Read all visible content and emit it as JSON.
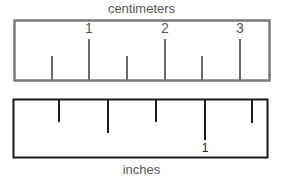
{
  "cm_ruler": {
    "title": "centimeters",
    "border_color": "#7a7a7a",
    "tick_color": "#6a6a6a",
    "labels": [
      {
        "text": "1",
        "x": 89
      },
      {
        "text": "2",
        "x": 165
      },
      {
        "text": "3",
        "x": 240
      }
    ],
    "ticks": [
      {
        "x": 52,
        "top": 56
      },
      {
        "x": 89,
        "top": 39
      },
      {
        "x": 127,
        "top": 56
      },
      {
        "x": 165,
        "top": 39
      },
      {
        "x": 202,
        "top": 56
      },
      {
        "x": 240,
        "top": 39
      }
    ]
  },
  "inch_ruler": {
    "title": "inches",
    "border_color": "#1a1a1a",
    "tick_color": "#1a1a1a",
    "labels": [
      {
        "text": "1",
        "x": 205
      }
    ],
    "ticks": [
      {
        "x": 59,
        "bottom": 122
      },
      {
        "x": 108,
        "bottom": 133
      },
      {
        "x": 156,
        "bottom": 122
      },
      {
        "x": 205,
        "bottom": 140
      },
      {
        "x": 252,
        "bottom": 123
      }
    ]
  }
}
